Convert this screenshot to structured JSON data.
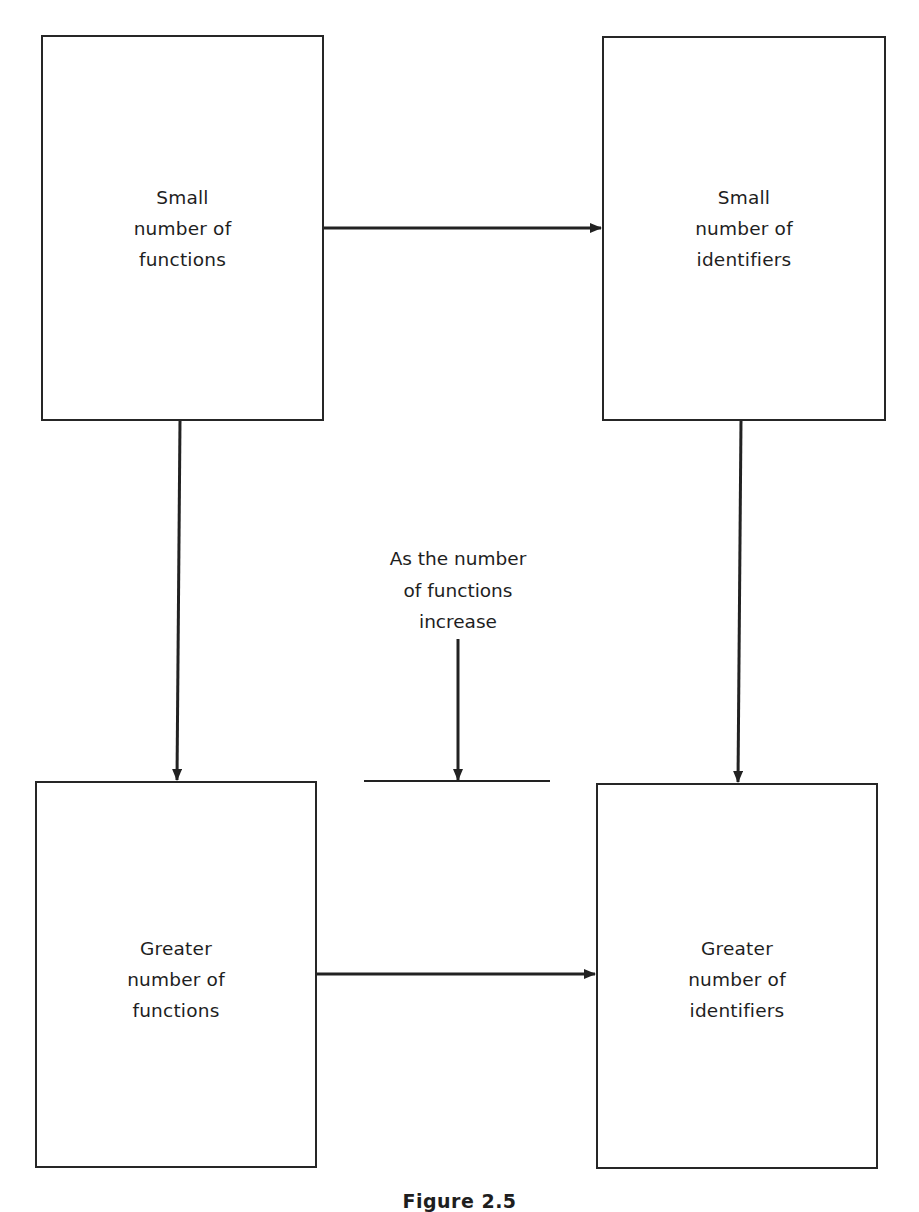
{
  "diagram": {
    "boxes": [
      {
        "id": "small-functions",
        "lines": [
          "Small",
          "number of",
          "functions"
        ]
      },
      {
        "id": "small-identifiers",
        "lines": [
          "Small",
          "number of",
          "identifiers"
        ]
      },
      {
        "id": "greater-functions",
        "lines": [
          "Greater",
          "number of",
          "functions"
        ]
      },
      {
        "id": "greater-identifiers",
        "lines": [
          "Greater",
          "number of",
          "identifiers"
        ]
      }
    ],
    "annotation": {
      "lines": [
        "As the number",
        "of functions",
        "increase"
      ]
    },
    "edges": [
      {
        "from": "small-functions",
        "to": "small-identifiers"
      },
      {
        "from": "small-functions",
        "to": "greater-functions"
      },
      {
        "from": "small-identifiers",
        "to": "greater-identifiers"
      },
      {
        "from": "greater-functions",
        "to": "greater-identifiers"
      },
      {
        "from": "annotation",
        "to": "transition-bar"
      }
    ],
    "caption": "Figure 2.5"
  }
}
